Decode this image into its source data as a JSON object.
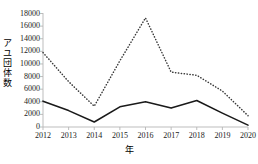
{
  "chart_data": {
    "type": "line",
    "title": "",
    "xlabel": "年",
    "ylabel": "アユ団体数",
    "categories": [
      "2012",
      "2013",
      "2014",
      "2015",
      "2016",
      "2017",
      "2018",
      "2019",
      "2020"
    ],
    "x": [
      2012,
      2013,
      2014,
      2015,
      2016,
      2017,
      2018,
      2019,
      2020
    ],
    "series": [
      {
        "name": "dotted-series",
        "style": "dotted",
        "color": "#3a3a3a",
        "values": [
          11800,
          7200,
          3300,
          10500,
          17300,
          8700,
          8200,
          5700,
          1800
        ]
      },
      {
        "name": "solid-series",
        "style": "solid",
        "color": "#1a1a1a",
        "values": [
          4100,
          2600,
          800,
          3200,
          4000,
          3000,
          4200,
          2200,
          300
        ]
      }
    ],
    "ylim": [
      0,
      18000
    ],
    "yticks": [
      0,
      2000,
      4000,
      6000,
      8000,
      10000,
      12000,
      14000,
      16000,
      18000
    ],
    "ytick_labels": [
      "0",
      "2000",
      "4000",
      "6000",
      "8000",
      "10000",
      "12000",
      "14000",
      "16000",
      "18000"
    ],
    "xlim": [
      2012,
      2020
    ],
    "grid": false,
    "legend": "none",
    "axis_color": "#b5b5b5",
    "text_color": "#222222"
  }
}
